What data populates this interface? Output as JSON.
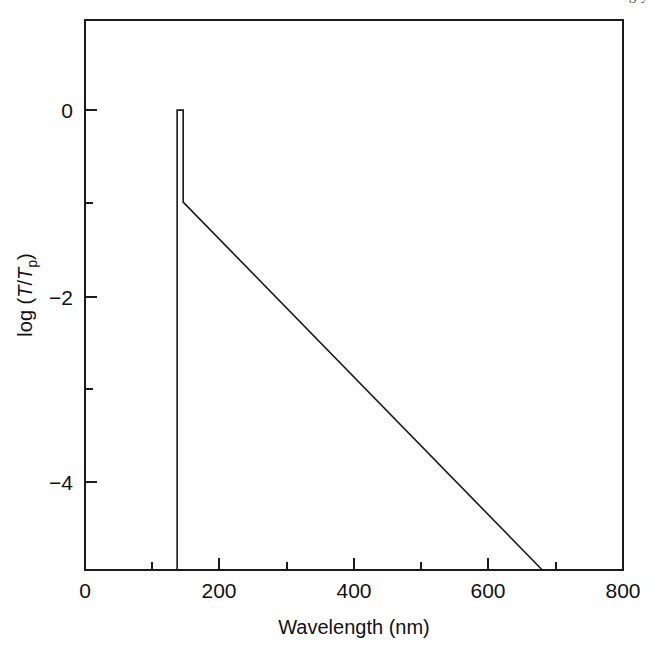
{
  "figure": {
    "caption_bleed_text": "g  y",
    "background_color": "#ffffff",
    "line_color": "#1a1a1a"
  },
  "chart_data": {
    "type": "line",
    "title": "",
    "subtitle": "",
    "xlabel": "Wavelength (nm)",
    "ylabel": "log (T/Tp)",
    "ylabel_parts": {
      "prefix": "log (",
      "numerator": "T",
      "divider": "/",
      "denominator": "T",
      "denominator_sub": "p",
      "suffix": ")"
    },
    "xlim": [
      0,
      800
    ],
    "ylim": [
      -4.95,
      0.97
    ],
    "grid": false,
    "legend": null,
    "x_ticks_major": [
      0,
      200,
      400,
      600,
      800
    ],
    "x_tick_labels": [
      "0",
      "200",
      "400",
      "600",
      "800"
    ],
    "x_ticks_minor": [
      100,
      300,
      500,
      700
    ],
    "y_ticks_major": [
      0,
      -2,
      -4
    ],
    "y_tick_labels": [
      "0",
      "−2",
      "−4"
    ],
    "y_ticks_minor": [
      -1,
      -3
    ],
    "series": [
      {
        "name": "transmission",
        "color": "#1a1a1a",
        "points": [
          {
            "x": 137,
            "y": -4.95
          },
          {
            "x": 137,
            "y": 0.0
          },
          {
            "x": 146,
            "y": 0.0
          },
          {
            "x": 146,
            "y": -0.99
          },
          {
            "x": 680,
            "y": -4.95
          }
        ]
      }
    ],
    "annotations": []
  }
}
